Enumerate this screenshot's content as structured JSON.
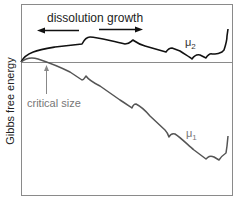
{
  "diagram": {
    "ylabel": "Gibbs free energy",
    "annotations": {
      "dissolution_growth": "dissolution growth",
      "critical_size": "critical size",
      "mu2": "μ",
      "mu2_sub": "2",
      "mu1": "μ",
      "mu1_sub": "1"
    },
    "colors": {
      "frame": "#888888",
      "mu2_curve": "#111111",
      "mu1_curve": "#555555",
      "text": "#222222",
      "gray_text": "#777777"
    }
  }
}
